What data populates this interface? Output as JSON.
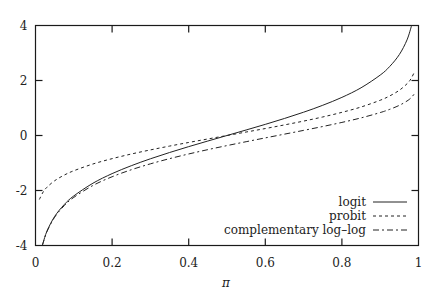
{
  "chart_data": {
    "type": "line",
    "title": "",
    "xlabel": "π",
    "ylabel": "",
    "xlim": [
      0,
      1
    ],
    "ylim": [
      -4,
      4
    ],
    "xticks": [
      0,
      0.2,
      0.4,
      0.6,
      0.8,
      1
    ],
    "xtick_labels": [
      "0",
      "0.2",
      "0.4",
      "0.6",
      "0.8",
      "1"
    ],
    "yticks": [
      -4,
      -2,
      0,
      2,
      4
    ],
    "ytick_labels": [
      "-4",
      "-2",
      "0",
      "2",
      "4"
    ],
    "grid": false,
    "legend_position": "bottom-right",
    "series": [
      {
        "name": "logit",
        "style": "solid",
        "x": [
          0.018,
          0.02,
          0.03,
          0.05,
          0.075,
          0.1,
          0.15,
          0.2,
          0.25,
          0.3,
          0.35,
          0.4,
          0.45,
          0.5,
          0.55,
          0.6,
          0.65,
          0.7,
          0.75,
          0.8,
          0.85,
          0.9,
          0.925,
          0.95,
          0.97,
          0.982
        ],
        "y": [
          -4.0,
          -3.892,
          -3.476,
          -2.944,
          -2.512,
          -2.197,
          -1.735,
          -1.386,
          -1.099,
          -0.847,
          -0.619,
          -0.405,
          -0.201,
          0,
          0.201,
          0.405,
          0.619,
          0.847,
          1.099,
          1.386,
          1.735,
          2.197,
          2.512,
          2.944,
          3.476,
          4.0
        ]
      },
      {
        "name": "probit",
        "style": "dashed",
        "x": [
          0.01,
          0.02,
          0.03,
          0.05,
          0.075,
          0.1,
          0.15,
          0.2,
          0.25,
          0.3,
          0.35,
          0.4,
          0.45,
          0.5,
          0.55,
          0.6,
          0.65,
          0.7,
          0.75,
          0.8,
          0.85,
          0.9,
          0.925,
          0.95,
          0.97,
          0.98,
          0.99
        ],
        "y": [
          -2.326,
          -2.054,
          -1.881,
          -1.645,
          -1.44,
          -1.282,
          -1.036,
          -0.842,
          -0.674,
          -0.524,
          -0.385,
          -0.253,
          -0.126,
          0,
          0.126,
          0.253,
          0.385,
          0.524,
          0.674,
          0.842,
          1.036,
          1.282,
          1.44,
          1.645,
          1.881,
          2.054,
          2.326
        ]
      },
      {
        "name": "complementary log–log",
        "style": "dash-dot",
        "x": [
          0.018,
          0.02,
          0.03,
          0.05,
          0.075,
          0.1,
          0.15,
          0.2,
          0.25,
          0.3,
          0.35,
          0.4,
          0.45,
          0.5,
          0.55,
          0.6,
          0.65,
          0.7,
          0.75,
          0.8,
          0.85,
          0.9,
          0.925,
          0.95,
          0.97,
          0.98,
          0.99
        ],
        "y": [
          -4.0,
          -3.902,
          -3.491,
          -2.97,
          -2.552,
          -2.25,
          -1.817,
          -1.5,
          -1.246,
          -1.031,
          -0.842,
          -0.672,
          -0.514,
          -0.367,
          -0.225,
          -0.087,
          0.049,
          0.186,
          0.327,
          0.476,
          0.64,
          0.834,
          0.952,
          1.097,
          1.255,
          1.364,
          1.527
        ]
      }
    ]
  }
}
